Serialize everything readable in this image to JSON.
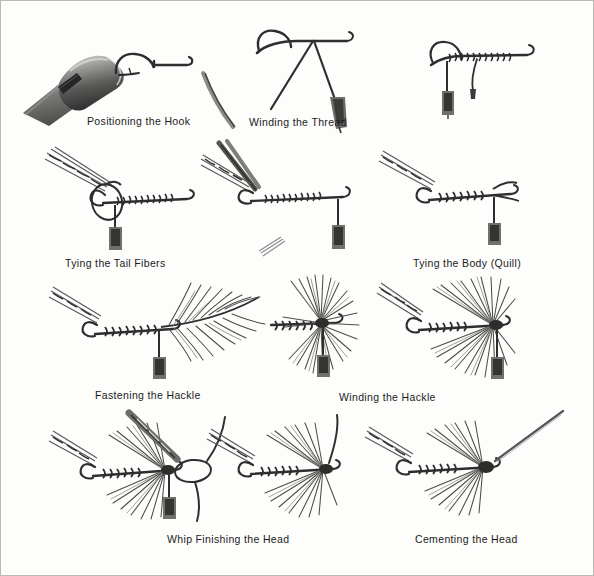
{
  "plate": {
    "title": "Fly Tying Step Sequence",
    "background_color": "#fdfdfb",
    "ink_color": "#2e2e2e",
    "border_color": "#b9b9b5",
    "medium": "grayscale pen-and-ink / halftone illustration",
    "columns": 3,
    "rows": 4,
    "figure_count": 8
  },
  "steps": [
    {
      "index": 1,
      "label": "Positioning the Hook",
      "row": 1,
      "column": 1,
      "illustration": "fly-tying vise clamping a bare hook by the bend, hook shank and eye pointing right",
      "parts": [
        "vise jaws",
        "vise barrel",
        "thumbscrew collar",
        "bare hook"
      ]
    },
    {
      "index": 2,
      "label": "Winding the Thread",
      "row": 1,
      "column": 2,
      "illustration": "hook held in vise with bobbin and thread being drawn down over the shank, thread crossing to form a V",
      "parts": [
        "hook",
        "tying thread",
        "bobbin tube",
        "vise jaw"
      ]
    },
    {
      "index": 3,
      "label": "Tying the Body (Quill)",
      "row": 2,
      "column": 3,
      "illustration": "hook with quill body wound along the shank, tail fibers angled up at rear, bobbin hanging at the head",
      "parts": [
        "quill body",
        "tail fibers",
        "bobbin",
        "hook eye"
      ]
    },
    {
      "index": 4,
      "label": "Tying the Tail Fibers",
      "row": 2,
      "column": 1,
      "illustration": "tail fibers lashed to the rear of the hook shank with a thread loop, bobbin hanging below",
      "parts": [
        "tail fibers",
        "thread loop",
        "wound shank",
        "bobbin"
      ]
    },
    {
      "index": 5,
      "label": "Fastening the Hackle",
      "row": 3,
      "column": 1,
      "illustration": "long hackle feather tied in at the head of the hook, barbs fanning back and to the right",
      "parts": [
        "hackle feather",
        "quill body",
        "tail fibers",
        "bobbin"
      ]
    },
    {
      "index": 6,
      "label": "Winding the Hackle",
      "row": 3,
      "column": 2,
      "illustration": "hackle wound in turns around the shank forming a dense radiating collar of barbs",
      "parts": [
        "wound hackle collar",
        "body",
        "bobbin"
      ]
    },
    {
      "index": 7,
      "label": "Whip Finishing the Head",
      "row": 4,
      "column": 1,
      "illustration": "finished fly with hackle collar, a whip-finish thread loop being pulled around the head, bobbin hanging",
      "parts": [
        "whip finish loop",
        "hackle collar",
        "head",
        "bobbin"
      ]
    },
    {
      "index": 8,
      "label": "Cementing the Head",
      "row": 4,
      "column": 3,
      "illustration": "completed dry fly with a fine applicator needle touching head cement to the thread head",
      "parts": [
        "applicator needle",
        "head",
        "hackle collar",
        "quill body",
        "tail"
      ]
    }
  ],
  "unlabeled_figures": [
    {
      "row": 1,
      "column": 3,
      "illustration": "hook with thread fully wound along the shank and bobbin hanging straight down"
    },
    {
      "row": 2,
      "column": 2,
      "illustration": "tail fibers being held with tweezers against the wound shank while thread secures them"
    },
    {
      "row": 3,
      "column": 3,
      "illustration": "hackle wound and swept back over the body forming a wet-fly profile"
    },
    {
      "row": 4,
      "column": 2,
      "illustration": "completed fly with swept hackle and tag end of thread trimmed upward"
    }
  ],
  "captions": {
    "positioning_the_hook": "Positioning the Hook",
    "winding_the_thread": "Winding the Thread",
    "tying_the_tail_fibers": "Tying the Tail Fibers",
    "tying_the_body_quill": "Tying the Body (Quill)",
    "fastening_the_hackle": "Fastening the Hackle",
    "winding_the_hackle": "Winding the Hackle",
    "whip_finishing_the_head": "Whip Finishing the Head",
    "cementing_the_head": "Cementing the Head"
  }
}
